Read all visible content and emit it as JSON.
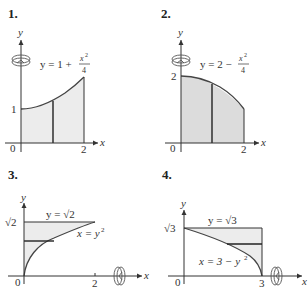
{
  "figures": [
    {
      "number": "1.",
      "axis_x": "x",
      "axis_y": "y",
      "equation_lhs": "y = 1 + ",
      "equation_num": "x",
      "equation_exp": "2",
      "equation_den": "4",
      "tick_origin": "0",
      "tick_x": "2",
      "tick_y": "1",
      "rotation_axis": "y-axis"
    },
    {
      "number": "2.",
      "axis_x": "x",
      "axis_y": "y",
      "equation_lhs": "y = 2 − ",
      "equation_num": "x",
      "equation_exp": "2",
      "equation_den": "4",
      "tick_origin": "0",
      "tick_x": "2",
      "tick_y": "2",
      "rotation_axis": "y-axis"
    },
    {
      "number": "3.",
      "axis_x": "x",
      "axis_y": "y",
      "equation_top": "y = √2",
      "equation_curve": "x = y",
      "equation_curve_exp": "2",
      "tick_origin": "0",
      "tick_x": "2",
      "tick_y": "√2",
      "rotation_axis": "x-axis"
    },
    {
      "number": "4.",
      "axis_x": "x",
      "axis_y": "y",
      "equation_top": "y = √3",
      "equation_curve": "x = 3 − y",
      "equation_curve_exp": "2",
      "tick_origin": "0",
      "tick_x": "3",
      "tick_y": "√3",
      "rotation_axis": "x-axis"
    }
  ],
  "colors": {
    "region_fill_light": "#ececec",
    "region_fill_dark": "#dcdcdc",
    "line": "#333333"
  }
}
